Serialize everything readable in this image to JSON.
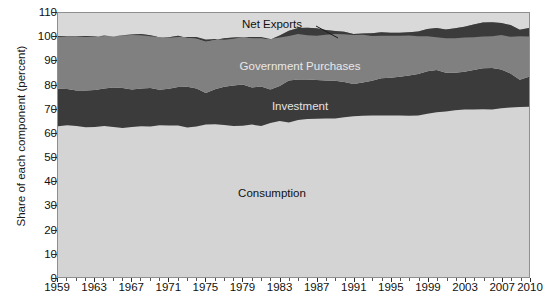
{
  "chart_data": {
    "type": "area",
    "title": "",
    "xlabel": "",
    "ylabel": "Share of each component (percent)",
    "xlim": [
      1959,
      2010
    ],
    "ylim": [
      0,
      110
    ],
    "grid": false,
    "stacked": true,
    "legend_position": "inline-labels",
    "x_tick_labels": [
      "1959",
      "1963",
      "1967",
      "1971",
      "1975",
      "1979",
      "1983",
      "1987",
      "1991",
      "1995",
      "1999",
      "2003",
      "2007",
      "2010"
    ],
    "x_tick_values": [
      1959,
      1963,
      1967,
      1971,
      1975,
      1979,
      1983,
      1987,
      1991,
      1995,
      1999,
      2003,
      2007,
      2010
    ],
    "y_tick_labels": [
      "0",
      "10",
      "20",
      "30",
      "40",
      "50",
      "60",
      "70",
      "80",
      "90",
      "100",
      "110"
    ],
    "y_tick_values": [
      0,
      10,
      20,
      30,
      40,
      50,
      60,
      70,
      80,
      90,
      100,
      110
    ],
    "x": [
      1959,
      1960,
      1961,
      1962,
      1963,
      1964,
      1965,
      1966,
      1967,
      1968,
      1969,
      1970,
      1971,
      1972,
      1973,
      1974,
      1975,
      1976,
      1977,
      1978,
      1979,
      1980,
      1981,
      1982,
      1983,
      1984,
      1985,
      1986,
      1987,
      1988,
      1989,
      1990,
      1991,
      1992,
      1993,
      1994,
      1995,
      1996,
      1997,
      1998,
      1999,
      2000,
      2001,
      2002,
      2003,
      2004,
      2005,
      2006,
      2007,
      2008,
      2009,
      2010
    ],
    "series": [
      {
        "name": "Consumption",
        "color": "#d4d4d4",
        "values": [
          62.8,
          63.2,
          62.9,
          62.4,
          62.5,
          62.9,
          62.5,
          62.1,
          62.5,
          62.8,
          62.7,
          63.2,
          63.1,
          63.1,
          62.3,
          62.7,
          63.5,
          63.6,
          63.3,
          62.9,
          63.0,
          63.5,
          62.9,
          64.2,
          65.0,
          64.4,
          65.4,
          65.8,
          65.9,
          66.0,
          66.0,
          66.6,
          67.0,
          67.2,
          67.3,
          67.3,
          67.3,
          67.3,
          67.2,
          67.3,
          68.0,
          68.6,
          69.0,
          69.5,
          69.8,
          69.8,
          69.9,
          69.8,
          70.3,
          70.6,
          70.8,
          70.9
        ]
      },
      {
        "name": "Investment",
        "color": "#3b3b3b",
        "values": [
          15.6,
          15.1,
          14.8,
          15.3,
          15.4,
          15.6,
          16.5,
          16.6,
          15.6,
          15.7,
          16.0,
          14.8,
          15.3,
          16.1,
          17.0,
          15.8,
          13.2,
          14.6,
          16.0,
          16.9,
          17.2,
          15.5,
          16.5,
          13.9,
          14.6,
          17.5,
          16.9,
          16.5,
          16.2,
          15.9,
          15.8,
          14.7,
          13.4,
          13.8,
          14.5,
          15.5,
          15.7,
          16.1,
          16.8,
          17.3,
          17.7,
          17.7,
          16.1,
          15.6,
          15.7,
          16.5,
          17.1,
          17.3,
          16.2,
          14.2,
          11.4,
          12.5
        ]
      },
      {
        "name": "Government Purchases",
        "color": "#808080",
        "values": [
          22.0,
          21.9,
          22.5,
          22.7,
          22.3,
          21.8,
          21.2,
          22.0,
          22.9,
          22.7,
          22.0,
          21.9,
          21.5,
          21.3,
          20.3,
          20.8,
          21.3,
          20.5,
          20.2,
          20.0,
          19.8,
          20.4,
          20.0,
          20.9,
          21.0,
          20.7,
          21.4,
          21.6,
          21.5,
          21.0,
          20.7,
          20.9,
          20.8,
          20.5,
          19.8,
          19.2,
          18.8,
          18.4,
          18.0,
          17.7,
          17.6,
          17.5,
          18.0,
          18.5,
          18.8,
          18.9,
          19.0,
          19.0,
          19.3,
          20.2,
          20.8,
          20.3
        ]
      },
      {
        "name": "Net Exports",
        "color": "#3b3b3b",
        "values": [
          -0.4,
          -0.2,
          -0.2,
          -0.4,
          -0.2,
          0.3,
          0.0,
          -0.1,
          -0.2,
          -0.5,
          -0.4,
          0.1,
          -0.2,
          -0.5,
          0.4,
          0.7,
          1.0,
          0.5,
          -0.6,
          -0.5,
          0.0,
          0.6,
          0.6,
          0.2,
          -0.8,
          -2.2,
          -2.5,
          -3.2,
          -3.1,
          -2.0,
          -1.2,
          -1.1,
          -0.4,
          -0.6,
          -1.2,
          -1.5,
          -1.3,
          -1.3,
          -1.4,
          -2.0,
          -3.0,
          -3.9,
          -3.6,
          -4.1,
          -4.5,
          -5.3,
          -5.8,
          -5.8,
          -5.0,
          -4.9,
          -2.7,
          -3.5
        ]
      }
    ],
    "annotations": [
      {
        "name": "net-exports-label",
        "text": "Net Exports",
        "x": 1985,
        "y": 106
      },
      {
        "name": "government-purchases-label",
        "text": "Government Purchases",
        "x": 1988,
        "y": 89
      },
      {
        "name": "investment-label",
        "text": "Investment",
        "x": 1988,
        "y": 73
      },
      {
        "name": "consumption-label",
        "text": "Consumption",
        "x": 1985,
        "y": 38
      }
    ]
  },
  "axes": {
    "ylabel": "Share of each component (percent)"
  },
  "labels": {
    "net_exports": "Net Exports",
    "government_purchases": "Government Purchases",
    "investment": "Investment",
    "consumption": "Consumption"
  }
}
